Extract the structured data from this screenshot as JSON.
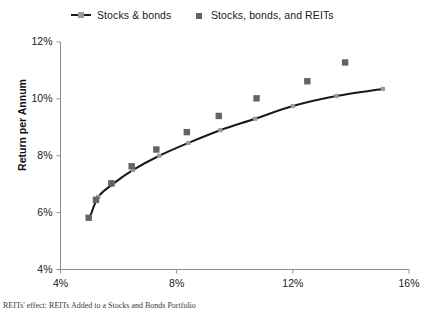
{
  "chart_data": {
    "type": "scatter",
    "title": "",
    "xlabel": "",
    "ylabel": "Return per Annum",
    "xlim": [
      4,
      16
    ],
    "ylim": [
      4,
      12
    ],
    "xticks": [
      "4%",
      "8%",
      "12%",
      "16%"
    ],
    "xtick_values": [
      4,
      8,
      12,
      16
    ],
    "yticks": [
      "4%",
      "6%",
      "8%",
      "10%",
      "12%"
    ],
    "ytick_values": [
      4,
      6,
      8,
      10,
      12
    ],
    "grid": false,
    "legend_position": "top",
    "axis_units": "percent",
    "series": [
      {
        "name": "Stocks & bonds",
        "type": "line",
        "marker": "small-diamond",
        "color": "#1a1a1a",
        "marker_color": "#9a9a9a",
        "points": [
          {
            "x": 5.0,
            "y": 5.8
          },
          {
            "x": 5.3,
            "y": 6.55
          },
          {
            "x": 5.8,
            "y": 7.0
          },
          {
            "x": 6.5,
            "y": 7.5
          },
          {
            "x": 7.4,
            "y": 8.0
          },
          {
            "x": 8.4,
            "y": 8.45
          },
          {
            "x": 9.5,
            "y": 8.9
          },
          {
            "x": 10.7,
            "y": 9.3
          },
          {
            "x": 12.0,
            "y": 9.75
          },
          {
            "x": 13.5,
            "y": 10.1
          },
          {
            "x": 15.1,
            "y": 10.35
          }
        ]
      },
      {
        "name": "Stocks, bonds, and REITs",
        "type": "scatter",
        "marker": "square",
        "color": "#646464",
        "points": [
          {
            "x": 4.97,
            "y": 5.82
          },
          {
            "x": 5.22,
            "y": 6.45
          },
          {
            "x": 5.75,
            "y": 7.03
          },
          {
            "x": 6.45,
            "y": 7.63
          },
          {
            "x": 7.3,
            "y": 8.22
          },
          {
            "x": 8.35,
            "y": 8.83
          },
          {
            "x": 9.45,
            "y": 9.4
          },
          {
            "x": 10.75,
            "y": 10.02
          },
          {
            "x": 12.5,
            "y": 10.62
          },
          {
            "x": 13.8,
            "y": 11.28
          }
        ]
      }
    ]
  },
  "legend": {
    "entries": [
      {
        "label": "Stocks & bonds",
        "key": "line-marker-key"
      },
      {
        "label": "Stocks, bonds, and REITs",
        "key": "square-key"
      }
    ]
  },
  "axes": {
    "y_title": "Return per Annum",
    "y_ticks": [
      "12%",
      "10%",
      "8%",
      "6%",
      "4%"
    ],
    "x_ticks": [
      "4%",
      "8%",
      "12%",
      "16%"
    ]
  },
  "caption": "REITs' effect: REITs Added to a Stocks and Bonds Portfolio"
}
